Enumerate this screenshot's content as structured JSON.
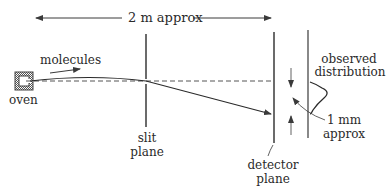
{
  "diagram": {
    "colors": {
      "ink": "#3a3a3a",
      "dash": "#555555"
    },
    "labels": {
      "distance": "2 m approx",
      "molecules": "molecules",
      "oven": "oven",
      "slit_line1": "slit",
      "slit_line2": "plane",
      "detector_line1": "detector",
      "detector_line2": "plane",
      "observed_line1": "observed",
      "observed_line2": "distribution",
      "mm_line1": "1 mm",
      "mm_line2": "approx"
    },
    "components": [
      {
        "id": "oven",
        "icon": "oven-box-icon"
      },
      {
        "id": "slit-plane",
        "icon": "vertical-plane"
      },
      {
        "id": "detector-plane",
        "icon": "vertical-plane"
      },
      {
        "id": "observed-distribution",
        "icon": "gaussian-curve-icon"
      }
    ]
  }
}
